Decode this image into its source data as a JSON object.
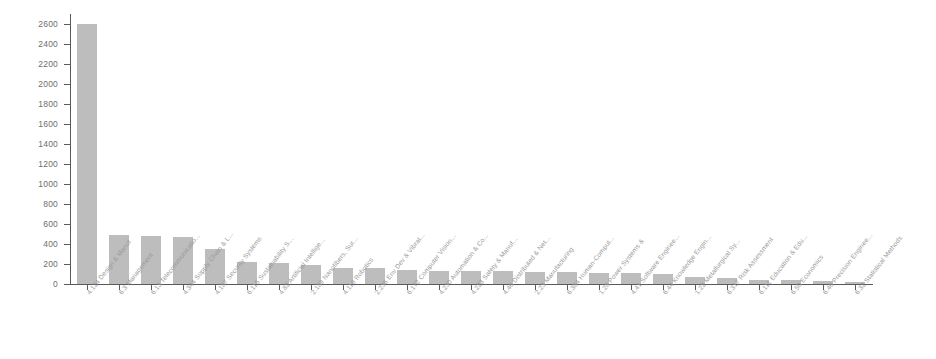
{
  "chart_data": {
    "type": "bar",
    "title": "",
    "subtitle": "",
    "xlabel": "",
    "ylabel": "",
    "ylim": [
      0,
      2700
    ],
    "grid": false,
    "legend": "none",
    "orientation": "vertical",
    "bar_color": "#bdbdbd",
    "axis_color": "#5a5a5a",
    "tick_label_color": "#6e6e6e",
    "xlabel_rotation_deg": -52,
    "y_ticks": [
      0,
      200,
      400,
      600,
      800,
      1000,
      1200,
      1400,
      1600,
      1800,
      2000,
      2200,
      2400,
      2600
    ],
    "y_tick_labels": [
      "0",
      "200",
      "400",
      "600",
      "800",
      "1000",
      "1200",
      "1400",
      "1600",
      "1800",
      "2000",
      "2200",
      "2400",
      "2600"
    ],
    "categories": [
      "4.124 Design & Manuf",
      "6.3 Management",
      "6.13 Telecommunicatio...",
      "4.344 Supply Chain & L...",
      "4.187 Security Systems",
      "6.115 Sustainability S...",
      "4.82 Artificial Intellige...",
      "2.189 Nanofibers, Sur...",
      "4.118 Robotics",
      "2.236 Env Dev & Vibrat...",
      "6.172 Computer Vision...",
      "4.230 Automation & Co...",
      "4.223 Safety & Manuf...",
      "4.46 Distributed & Net...",
      "2.23 Manufacturing",
      "6.384 Human-Comput...",
      "1.28 Power Systems &",
      "4.41 Software Enginee...",
      "6.44 Knowledge Engin...",
      "1.22 Metallurgical Sy...",
      "6.317 Risk Assessment",
      "6.111 Education & Edu...",
      "6.50 Economics",
      "6.46 Precision Enginee...",
      "6.32 Statistical Methods"
    ],
    "values": [
      2600,
      490,
      480,
      475,
      350,
      220,
      210,
      195,
      160,
      165,
      140,
      135,
      130,
      130,
      125,
      120,
      115,
      110,
      105,
      70,
      60,
      45,
      40,
      35,
      25
    ]
  }
}
